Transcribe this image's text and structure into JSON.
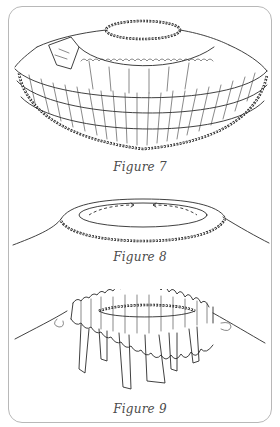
{
  "page": {
    "type": "illustration-plate",
    "border_color": "#b8b8b8",
    "ink_color": "#2b2b2b",
    "caption_color": "#4a4a4a"
  },
  "figures": [
    {
      "id": "figure-7",
      "caption": "Figure 7",
      "subject": "tiered-ruffle-skirt-with-braided-trim"
    },
    {
      "id": "figure-8",
      "caption": "Figure 8",
      "subject": "rolled-hem-collar-with-dashed-stitch-line"
    },
    {
      "id": "figure-9",
      "caption": "Figure 9",
      "subject": "gathered-ruffle-band-with-hanging-strips"
    }
  ]
}
